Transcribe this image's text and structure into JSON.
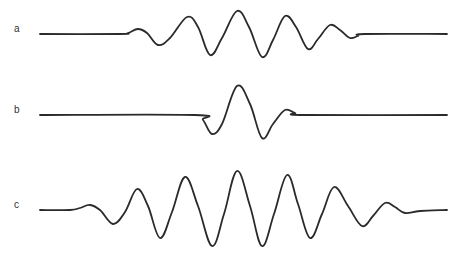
{
  "figure": {
    "traces": [
      {
        "id": "a",
        "label": "a",
        "label_pos": [
          14,
          29
        ],
        "baseline_y": 34,
        "points": [
          [
            40,
            34
          ],
          [
            120,
            34
          ],
          [
            128,
            33
          ],
          [
            138,
            29
          ],
          [
            147,
            33
          ],
          [
            158,
            45
          ],
          [
            170,
            38
          ],
          [
            187,
            17
          ],
          [
            198,
            27
          ],
          [
            210,
            55
          ],
          [
            222,
            38
          ],
          [
            237,
            11
          ],
          [
            249,
            27
          ],
          [
            262,
            57
          ],
          [
            273,
            40
          ],
          [
            285,
            16
          ],
          [
            296,
            27
          ],
          [
            308,
            49
          ],
          [
            318,
            39
          ],
          [
            330,
            25
          ],
          [
            340,
            30
          ],
          [
            350,
            38
          ],
          [
            358,
            36
          ],
          [
            365,
            34
          ],
          [
            447,
            34
          ]
        ]
      },
      {
        "id": "b",
        "label": "b",
        "label_pos": [
          14,
          110
        ],
        "baseline_y": 115,
        "points": [
          [
            40,
            115
          ],
          [
            195,
            115
          ],
          [
            203,
            120
          ],
          [
            212,
            134
          ],
          [
            222,
            124
          ],
          [
            237,
            86
          ],
          [
            250,
            104
          ],
          [
            262,
            138
          ],
          [
            273,
            124
          ],
          [
            285,
            110
          ],
          [
            295,
            113
          ],
          [
            305,
            115
          ],
          [
            447,
            115
          ]
        ]
      },
      {
        "id": "c",
        "label": "c",
        "label_pos": [
          14,
          205
        ],
        "baseline_y": 210,
        "points": [
          [
            40,
            210
          ],
          [
            70,
            210
          ],
          [
            80,
            208
          ],
          [
            90,
            205
          ],
          [
            100,
            210
          ],
          [
            113,
            224
          ],
          [
            125,
            212
          ],
          [
            137,
            189
          ],
          [
            148,
            206
          ],
          [
            160,
            238
          ],
          [
            172,
            212
          ],
          [
            185,
            177
          ],
          [
            198,
            206
          ],
          [
            212,
            246
          ],
          [
            224,
            214
          ],
          [
            237,
            171
          ],
          [
            250,
            206
          ],
          [
            262,
            246
          ],
          [
            274,
            214
          ],
          [
            287,
            175
          ],
          [
            298,
            204
          ],
          [
            310,
            238
          ],
          [
            322,
            214
          ],
          [
            334,
            187
          ],
          [
            348,
            206
          ],
          [
            362,
            226
          ],
          [
            373,
            216
          ],
          [
            385,
            203
          ],
          [
            395,
            207
          ],
          [
            405,
            213
          ],
          [
            420,
            211
          ],
          [
            447,
            210
          ]
        ]
      }
    ]
  }
}
